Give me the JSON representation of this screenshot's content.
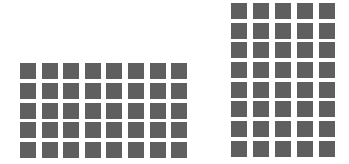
{
  "figure": {
    "background": "#ffffff",
    "square_color": "#5f5f5f",
    "grids": [
      {
        "name": "left",
        "columns": 8,
        "rows": 5,
        "count": 40
      },
      {
        "name": "right",
        "columns": 5,
        "rows": 8,
        "count": 40
      }
    ]
  }
}
